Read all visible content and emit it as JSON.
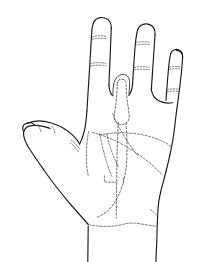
{
  "figure": {
    "view": "palmar",
    "style": "ink line drawing",
    "background_color": "#ffffff",
    "line_color": "#1a1a1a",
    "dashed_line_color": "#4a4a4a",
    "canvas": {
      "width": 198,
      "height": 262
    }
  },
  "parts": {
    "index_finger": {
      "name": "index-finger",
      "state": "extended",
      "crease_count": 2
    },
    "middle_finger": {
      "name": "middle-finger",
      "state": "flexed-hidden",
      "rendering": "dashed",
      "crease_count": 2
    },
    "ring_finger": {
      "name": "ring-finger",
      "state": "extended",
      "crease_count": 2
    },
    "little_finger": {
      "name": "little-finger",
      "state": "extended",
      "crease_count": 2
    },
    "thumb": {
      "name": "thumb",
      "state": "abducted",
      "crease_count": 2
    },
    "palm": {
      "name": "palm",
      "crease_count": 3
    },
    "wrist": {
      "name": "wrist",
      "crease_count": 1
    }
  },
  "annotations": {
    "labels": [],
    "caption": ""
  }
}
